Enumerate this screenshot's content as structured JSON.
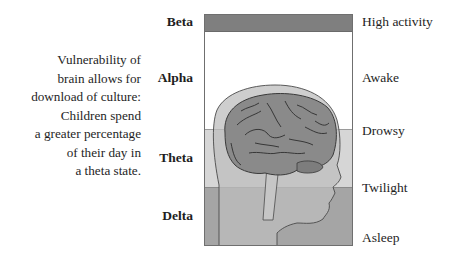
{
  "caption": {
    "lines": [
      "Vulnerability of",
      "brain allows for",
      "download of culture:",
      "Children spend",
      "a greater percentage",
      "of their day in",
      "a theta state."
    ]
  },
  "waves": [
    {
      "label": "Beta",
      "state": "High activity",
      "color": "#7f7f7f"
    },
    {
      "label": "Alpha",
      "state": "Awake",
      "color": "#ffffff"
    },
    {
      "label": "Theta",
      "state": "Drowsy",
      "color": "#d6d6d6"
    },
    {
      "label": "Theta",
      "state": "Twilight",
      "color": "#d6d6d6"
    },
    {
      "label": "Delta",
      "state": "Asleep",
      "color": "#a5a5a5"
    }
  ],
  "labels": {
    "beta": "Beta",
    "alpha": "Alpha",
    "theta": "Theta",
    "delta": "Delta"
  },
  "states": {
    "high_activity": "High activity",
    "awake": "Awake",
    "drowsy": "Drowsy",
    "twilight": "Twilight",
    "asleep": "Asleep"
  },
  "colors": {
    "beta_band": "#7f7f7f",
    "alpha_band": "#ffffff",
    "theta_band": "#d6d6d6",
    "delta_band": "#a5a5a5",
    "head": "#bdbdbd",
    "brain": "#8a8a8a",
    "outline": "#4a4a4a"
  }
}
